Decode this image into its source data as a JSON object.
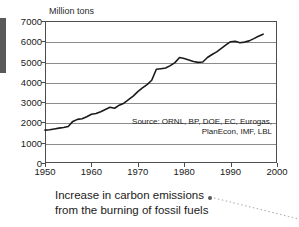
{
  "chart_data": {
    "type": "line",
    "title": "",
    "xlabel": "",
    "ylabel": "Million tons",
    "units_label": "Million tons",
    "xlim": [
      1950,
      2000
    ],
    "ylim": [
      0,
      7000
    ],
    "grid": true,
    "legend": "none",
    "xticks": [
      1950,
      1960,
      1970,
      1980,
      1990,
      2000
    ],
    "yticks": [
      0,
      1000,
      2000,
      3000,
      4000,
      5000,
      6000,
      7000
    ],
    "series": [
      {
        "name": "Carbon emissions from fossil fuels",
        "color": "#1a1a1a",
        "x": [
          1950,
          1951,
          1952,
          1953,
          1954,
          1955,
          1956,
          1957,
          1958,
          1959,
          1960,
          1961,
          1962,
          1963,
          1964,
          1965,
          1966,
          1967,
          1968,
          1969,
          1970,
          1971,
          1972,
          1973,
          1974,
          1975,
          1976,
          1977,
          1978,
          1979,
          1980,
          1981,
          1982,
          1983,
          1984,
          1985,
          1986,
          1987,
          1988,
          1989,
          1990,
          1991,
          1992,
          1993,
          1994,
          1995,
          1996,
          1997
        ],
        "y": [
          1620,
          1640,
          1680,
          1720,
          1750,
          1800,
          2050,
          2150,
          2180,
          2280,
          2400,
          2440,
          2530,
          2640,
          2750,
          2700,
          2850,
          2950,
          3120,
          3300,
          3520,
          3700,
          3860,
          4080,
          4620,
          4650,
          4680,
          4800,
          4950,
          5200,
          5150,
          5080,
          5000,
          4960,
          4980,
          5200,
          5350,
          5480,
          5650,
          5820,
          5980,
          6000,
          5930,
          5960,
          6020,
          6130,
          6250,
          6350
        ]
      }
    ],
    "annotations": [
      {
        "name": "source-note",
        "lines": [
          "Source: ORNL, BP, DOE, EC, Eurogas,",
          "PlanEcon, IMF, LBL"
        ]
      }
    ]
  },
  "caption": {
    "line1": "Increase in carbon emissions",
    "line2": "from the burning of fossil fuels"
  },
  "colors": {
    "line": "#1a1a1a",
    "grid": "#8c8c8c",
    "frame": "#4d4d4d",
    "leader": "#a6a6a6",
    "artifact": "#595959"
  }
}
